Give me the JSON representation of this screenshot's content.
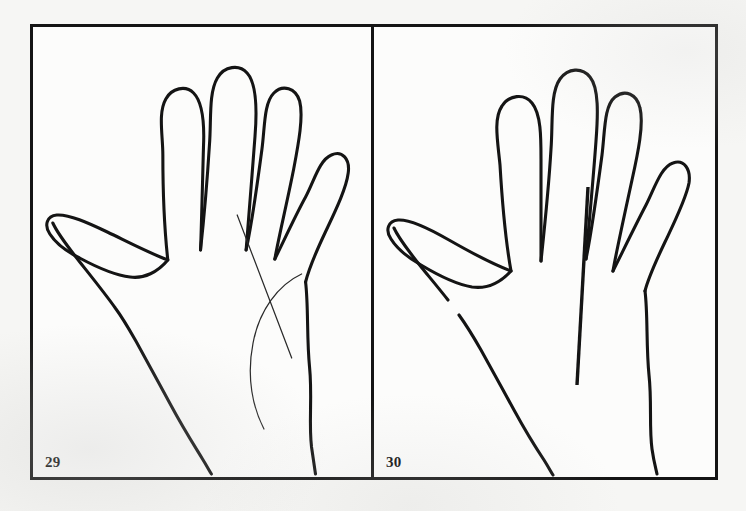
{
  "page": {
    "background_color": "#f6f6f4",
    "ink_color": "#141414",
    "top_bleed_text": "· · · · · · · · · · · ·"
  },
  "figure": {
    "frame_border_color": "#141414",
    "panel_background": "#fcfcfb",
    "panels": [
      {
        "number_label": "29",
        "caption_position": "bottom-left",
        "subject": "hand-outline-left-palm",
        "drawing_name": "hand-outline-29",
        "ink_color": "#141414",
        "marking_color": "#2a2a2a",
        "markings": [
          {
            "name": "straight-palm-line",
            "style": "thin-straight-diagonal",
            "description": "thin straight line running from below the index finger down toward the wrist"
          },
          {
            "name": "curved-palm-line",
            "style": "thin-curved-arc",
            "description": "thin arc crossing the straight line, curving down toward the base of the palm"
          }
        ]
      },
      {
        "number_label": "30",
        "caption_position": "bottom-left",
        "subject": "hand-outline-left-palm",
        "drawing_name": "hand-outline-30",
        "ink_color": "#141414",
        "marking_color": "#141414",
        "markings": [
          {
            "name": "vertical-palm-line",
            "style": "thick-straight-vertical",
            "description": "single heavy near-vertical line below the middle finger running down the palm"
          }
        ]
      }
    ]
  }
}
